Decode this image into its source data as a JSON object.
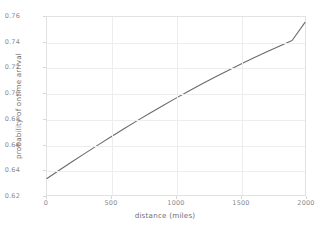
{
  "chart_data": {
    "type": "line",
    "title": "",
    "xlabel": "distance (miles)",
    "ylabel": "probability of ontime arrival",
    "xlim": [
      0,
      2000
    ],
    "ylim": [
      0.62,
      0.76
    ],
    "grid": true,
    "legend": null,
    "xticks": [
      0,
      500,
      1000,
      1500,
      2000
    ],
    "xtick_labels": [
      "0",
      "500",
      "1000",
      "1500",
      "2000"
    ],
    "yticks": [
      0.62,
      0.64,
      0.66,
      0.68,
      0.7,
      0.72,
      0.74,
      0.76
    ],
    "ytick_labels": [
      "0.62",
      "0.64",
      "0.66",
      "0.68",
      "0.70",
      "0.72",
      "0.74",
      "0.76"
    ],
    "line_color": "#6b6b6b",
    "grid_color": "#ededf0",
    "axis_color": "#e2e2e4",
    "tick_text_color": "#8a8a8f",
    "series": [
      {
        "name": "probability of ontime arrival",
        "x": [
          0,
          100,
          200,
          300,
          400,
          500,
          600,
          700,
          800,
          900,
          1000,
          1100,
          1200,
          1300,
          1400,
          1500,
          1600,
          1700,
          1800,
          1900,
          2000
        ],
        "y": [
          0.633,
          0.6398,
          0.6465,
          0.6531,
          0.6596,
          0.666,
          0.6723,
          0.6785,
          0.6845,
          0.6904,
          0.6962,
          0.7018,
          0.7073,
          0.7126,
          0.7178,
          0.7228,
          0.7277,
          0.7324,
          0.737,
          0.7415,
          0.7558
        ]
      }
    ]
  }
}
